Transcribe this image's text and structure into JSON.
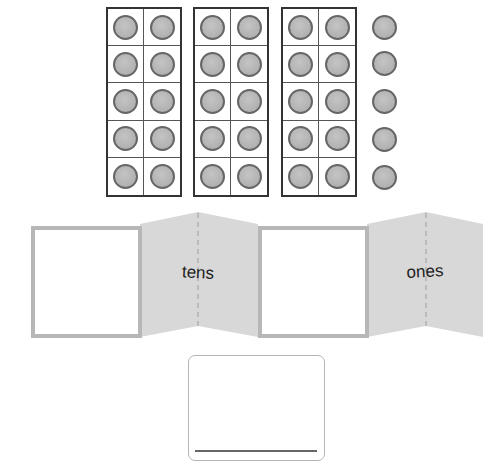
{
  "ten_frames": {
    "count": 3,
    "rows": 5,
    "columns": 2,
    "filled_per_frame": 10
  },
  "loose_counters": {
    "count": 5
  },
  "place_value_mat": {
    "tens_label": "tens",
    "ones_label": "ones",
    "tens_box_value": "",
    "ones_box_value": ""
  },
  "answer_box": {
    "value": ""
  },
  "colors": {
    "counter_fill": "#b5b5b5",
    "counter_stroke": "#666666",
    "frame_border": "#333333",
    "fold_panel": "#d9d9d9",
    "box_border": "#b7b7b7"
  }
}
